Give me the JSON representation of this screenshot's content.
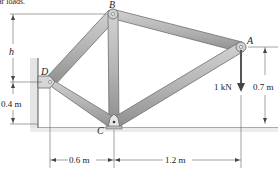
{
  "diagram": {
    "type": "truss-frame",
    "header_fragment": "ar loads.",
    "joints": [
      {
        "id": "A",
        "label": "A",
        "x": 241,
        "y": 47
      },
      {
        "id": "B",
        "label": "B",
        "x": 113,
        "y": 14
      },
      {
        "id": "C",
        "label": "C",
        "x": 114,
        "y": 124
      },
      {
        "id": "D",
        "label": "D",
        "x": 50,
        "y": 82
      }
    ],
    "members": [
      {
        "from": "D",
        "to": "B"
      },
      {
        "from": "B",
        "to": "A"
      },
      {
        "from": "B",
        "to": "C"
      },
      {
        "from": "D",
        "to": "C"
      },
      {
        "from": "C",
        "to": "A"
      }
    ],
    "load": {
      "label": "1 kN",
      "at": "A",
      "direction": "down"
    },
    "dimensions": {
      "h": "h",
      "d_height": "0.4 m",
      "a_height": "0.7 m",
      "dc_width": "0.6 m",
      "ca_width": "1.2 m"
    },
    "colors": {
      "member_fill": "#b9b9b9",
      "member_edge": "#6e6e6e",
      "line": "#444444",
      "wall": "#d8d8d8"
    }
  }
}
